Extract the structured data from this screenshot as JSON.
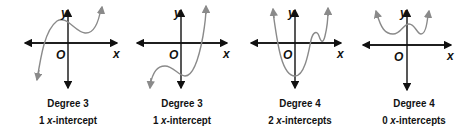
{
  "figure": {
    "axis_labels": {
      "x": "x",
      "y": "y",
      "origin": "O"
    },
    "colors": {
      "axis": "#111111",
      "curve": "#8a8a8a",
      "background": "#ffffff"
    },
    "panels": [
      {
        "degree_label": "Degree 3",
        "count": "1",
        "intercept_word": "x",
        "intercept_suffix": "-intercept"
      },
      {
        "degree_label": "Degree 3",
        "count": "1",
        "intercept_word": "x",
        "intercept_suffix": "-intercept"
      },
      {
        "degree_label": "Degree 4",
        "count": "2",
        "intercept_word": "x",
        "intercept_suffix": "-intercepts"
      },
      {
        "degree_label": "Degree 4",
        "count": "0",
        "intercept_word": "x",
        "intercept_suffix": "-intercepts"
      }
    ]
  }
}
